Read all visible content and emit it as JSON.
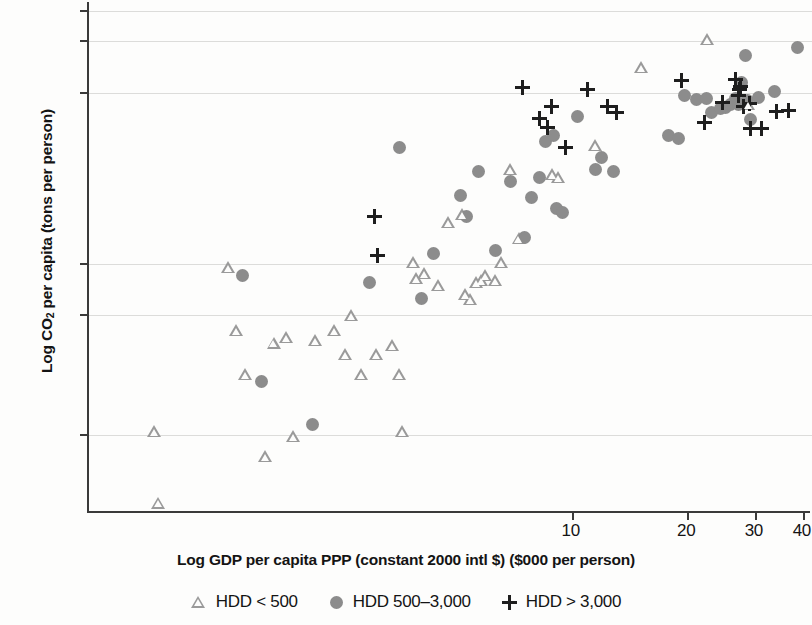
{
  "chart_data": {
    "type": "scatter",
    "title": "",
    "xlabel": "Log GDP per capita PPP (constant 2000 intl $) ($000 per person)",
    "ylabel": "Log CO2 per capita (tons per person)",
    "ylabel_parts": {
      "pre": "Log CO",
      "sub": "2",
      "post": " per capita (tons per person)"
    },
    "xscale": "log",
    "yscale": "log",
    "xticks": [
      10,
      20,
      30,
      40
    ],
    "xtick_labels": [
      "10",
      "20",
      "30",
      "40"
    ],
    "yticks": [
      0.1,
      0.5,
      1,
      10,
      20,
      30
    ],
    "ytick_labels": [
      "0.1",
      "0.5",
      "1",
      "10",
      "20",
      "30"
    ],
    "xlim": [
      0.55,
      42
    ],
    "ylim": [
      0.035,
      34
    ],
    "grid": true,
    "grid_axis": "y",
    "legend_position": "bottom-center",
    "series": [
      {
        "name": "HDD < 500",
        "marker": "triangle",
        "color": "#9a9a9a",
        "points": [
          [
            0.78,
            0.105
          ],
          [
            0.8,
            0.04
          ],
          [
            1.22,
            0.95
          ],
          [
            1.28,
            0.41
          ],
          [
            1.35,
            0.225
          ],
          [
            1.52,
            0.075
          ],
          [
            1.6,
            0.345
          ],
          [
            1.72,
            0.37
          ],
          [
            1.8,
            0.098
          ],
          [
            2.05,
            0.355
          ],
          [
            2.3,
            0.41
          ],
          [
            2.45,
            0.295
          ],
          [
            2.55,
            0.5
          ],
          [
            2.7,
            0.225
          ],
          [
            2.95,
            0.295
          ],
          [
            3.25,
            0.335
          ],
          [
            3.4,
            0.225
          ],
          [
            3.45,
            0.105
          ],
          [
            3.7,
            1.02
          ],
          [
            3.75,
            0.82
          ],
          [
            3.95,
            0.88
          ],
          [
            4.3,
            0.75
          ],
          [
            4.55,
            1.75
          ],
          [
            4.95,
            1.95
          ],
          [
            5.05,
            0.66
          ],
          [
            5.2,
            0.62
          ],
          [
            5.4,
            0.78
          ],
          [
            5.55,
            0.8
          ],
          [
            5.7,
            0.86
          ],
          [
            6.05,
            0.8
          ],
          [
            6.25,
            1.02
          ],
          [
            6.6,
            3.55
          ],
          [
            6.95,
            1.4
          ],
          [
            8.5,
            3.35
          ],
          [
            8.8,
            3.2
          ],
          [
            11.0,
            4.9
          ],
          [
            14.5,
            14.0
          ],
          [
            21.5,
            20.5
          ],
          [
            27.5,
            8.6
          ]
        ]
      },
      {
        "name": "HDD 500-3,000",
        "marker": "circle",
        "color": "#8c8c8c",
        "points": [
          [
            1.38,
            0.86
          ],
          [
            1.55,
            0.205
          ],
          [
            2.1,
            0.115
          ],
          [
            2.95,
            0.78
          ],
          [
            3.55,
            4.8
          ],
          [
            4.05,
            0.63
          ],
          [
            4.35,
            1.15
          ],
          [
            5.1,
            2.5
          ],
          [
            5.3,
            1.9
          ],
          [
            5.7,
            3.45
          ],
          [
            6.3,
            1.2
          ],
          [
            6.9,
            3.05
          ],
          [
            7.5,
            1.42
          ],
          [
            7.8,
            2.45
          ],
          [
            8.2,
            3.2
          ],
          [
            8.5,
            5.2
          ],
          [
            8.9,
            5.6
          ],
          [
            9.1,
            2.1
          ],
          [
            9.4,
            2.0
          ],
          [
            10.3,
            7.3
          ],
          [
            11.5,
            3.55
          ],
          [
            11.9,
            4.2
          ],
          [
            12.8,
            3.45
          ],
          [
            17.8,
            5.6
          ],
          [
            18.9,
            5.4
          ],
          [
            19.5,
            9.6
          ],
          [
            21.0,
            9.2
          ],
          [
            22.3,
            9.3
          ],
          [
            23.0,
            7.7
          ],
          [
            24.2,
            8.1
          ],
          [
            25.0,
            8.2
          ],
          [
            25.8,
            8.6
          ],
          [
            26.5,
            9.3
          ],
          [
            27.0,
            8.5
          ],
          [
            27.6,
            11.5
          ],
          [
            28.2,
            16.5
          ],
          [
            28.5,
            9.0
          ],
          [
            29.0,
            7.0
          ],
          [
            30.5,
            9.4
          ],
          [
            33.5,
            10.2
          ],
          [
            38.5,
            18.5
          ]
        ]
      },
      {
        "name": "HDD > 3,000",
        "marker": "plus",
        "color": "#1e1e1e",
        "points": [
          [
            3.05,
            1.9
          ],
          [
            3.1,
            1.12
          ],
          [
            7.4,
            10.8
          ],
          [
            8.2,
            7.1
          ],
          [
            8.6,
            6.3
          ],
          [
            8.8,
            8.3
          ],
          [
            9.6,
            4.8
          ],
          [
            10.9,
            10.5
          ],
          [
            12.3,
            8.3
          ],
          [
            13.0,
            7.7
          ],
          [
            19.2,
            11.8
          ],
          [
            22.0,
            6.7
          ],
          [
            24.5,
            8.8
          ],
          [
            26.5,
            12.0
          ],
          [
            27.0,
            9.6
          ],
          [
            27.2,
            10.4
          ],
          [
            27.3,
            10.9
          ],
          [
            27.8,
            8.3
          ],
          [
            28.8,
            8.7
          ],
          [
            29.0,
            6.2
          ],
          [
            31.0,
            6.2
          ],
          [
            34.0,
            7.8
          ],
          [
            36.5,
            7.9
          ]
        ]
      }
    ]
  },
  "legend": {
    "items": [
      {
        "label": "HDD < 500",
        "marker": "triangle"
      },
      {
        "label": "HDD 500–3,000",
        "marker": "circle"
      },
      {
        "label": "HDD > 3,000",
        "marker": "plus"
      }
    ]
  }
}
